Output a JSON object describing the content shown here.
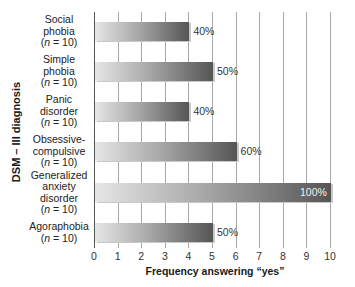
{
  "chart_data": {
    "type": "bar",
    "orientation": "horizontal",
    "title": "",
    "xlabel": "Frequency answering “yes”",
    "ylabel": "DSM – III diagnosis",
    "xlim": [
      0,
      10
    ],
    "xticks": [
      "0",
      "1",
      "2",
      "3",
      "4",
      "5",
      "6",
      "7",
      "8",
      "9",
      "10"
    ],
    "grid": true,
    "categories": [
      {
        "name_lines": [
          "Social",
          "phobia"
        ],
        "n_label": "(n = 10)"
      },
      {
        "name_lines": [
          "Simple",
          "phobia"
        ],
        "n_label": "(n = 10)"
      },
      {
        "name_lines": [
          "Panic",
          "disorder"
        ],
        "n_label": "(n = 10)"
      },
      {
        "name_lines": [
          "Obsessive-",
          "compulsive"
        ],
        "n_label": "(n = 10)"
      },
      {
        "name_lines": [
          "Generalized",
          "anxiety",
          "disorder"
        ],
        "n_label": "(n = 10)"
      },
      {
        "name_lines": [
          "Agoraphobia"
        ],
        "n_label": "(n = 10)"
      }
    ],
    "category_names": [
      "Social phobia",
      "Simple phobia",
      "Panic disorder",
      "Obsessive-compulsive",
      "Generalized anxiety disorder",
      "Agoraphobia"
    ],
    "values": [
      4,
      5,
      4,
      6,
      10,
      5
    ],
    "data_labels": [
      "40%",
      "50%",
      "40%",
      "60%",
      "100%",
      "50%"
    ],
    "bar_color": "#6e6e6e"
  }
}
